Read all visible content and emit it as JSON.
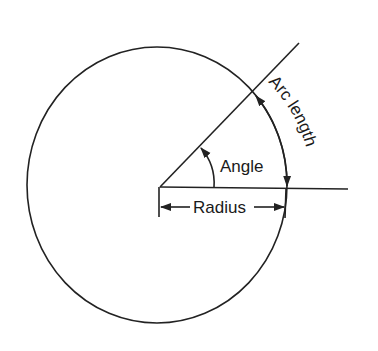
{
  "diagram": {
    "type": "geometry",
    "labels": {
      "angle": "Angle",
      "radius": "Radius",
      "arc_length": "Arc length"
    },
    "colors": {
      "line": "#222222",
      "background": "#ffffff"
    }
  }
}
